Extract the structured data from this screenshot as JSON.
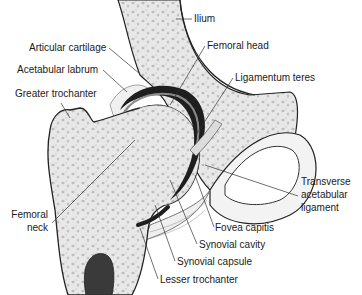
{
  "diagram": {
    "labels": {
      "ilium": "Ilium",
      "articular_cartilage": "Articular cartilage",
      "femoral_head": "Femoral head",
      "acetabular_labrum": "Acetabular labrum",
      "ligamentum_teres": "Ligamentum teres",
      "greater_trochanter": "Greater trochanter",
      "transverse_acetabular_ligament_1": "Transverse",
      "transverse_acetabular_ligament_2": "acetabular",
      "transverse_acetabular_ligament_3": "ligament",
      "femoral_neck_1": "Femoral",
      "femoral_neck_2": "neck",
      "fovea_capitis": "Fovea capitis",
      "synovial_cavity": "Synovial cavity",
      "synovial_capsule": "Synovial capsule",
      "lesser_trochanter": "Lesser trochanter"
    },
    "colors": {
      "bone_fill": "#e6e6e6",
      "bone_spots": "#b8b8b8",
      "cartilage_dark": "#1e1e1e",
      "outline": "#222222",
      "leader": "#333333"
    }
  }
}
